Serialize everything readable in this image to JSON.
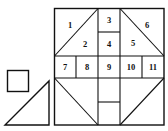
{
  "diagram": {
    "stroke_color": "#111111",
    "background_color": "#ffffff",
    "regions": [
      {
        "id": "1",
        "label": "1"
      },
      {
        "id": "2",
        "label": "2"
      },
      {
        "id": "3",
        "label": "3"
      },
      {
        "id": "4",
        "label": "4"
      },
      {
        "id": "5",
        "label": "5"
      },
      {
        "id": "6",
        "label": "6"
      },
      {
        "id": "7",
        "label": "7"
      },
      {
        "id": "8",
        "label": "8"
      },
      {
        "id": "9",
        "label": "9"
      },
      {
        "id": "10",
        "label": "10"
      },
      {
        "id": "11",
        "label": "11"
      }
    ],
    "loose_pieces": [
      "small-square",
      "right-triangle"
    ]
  }
}
